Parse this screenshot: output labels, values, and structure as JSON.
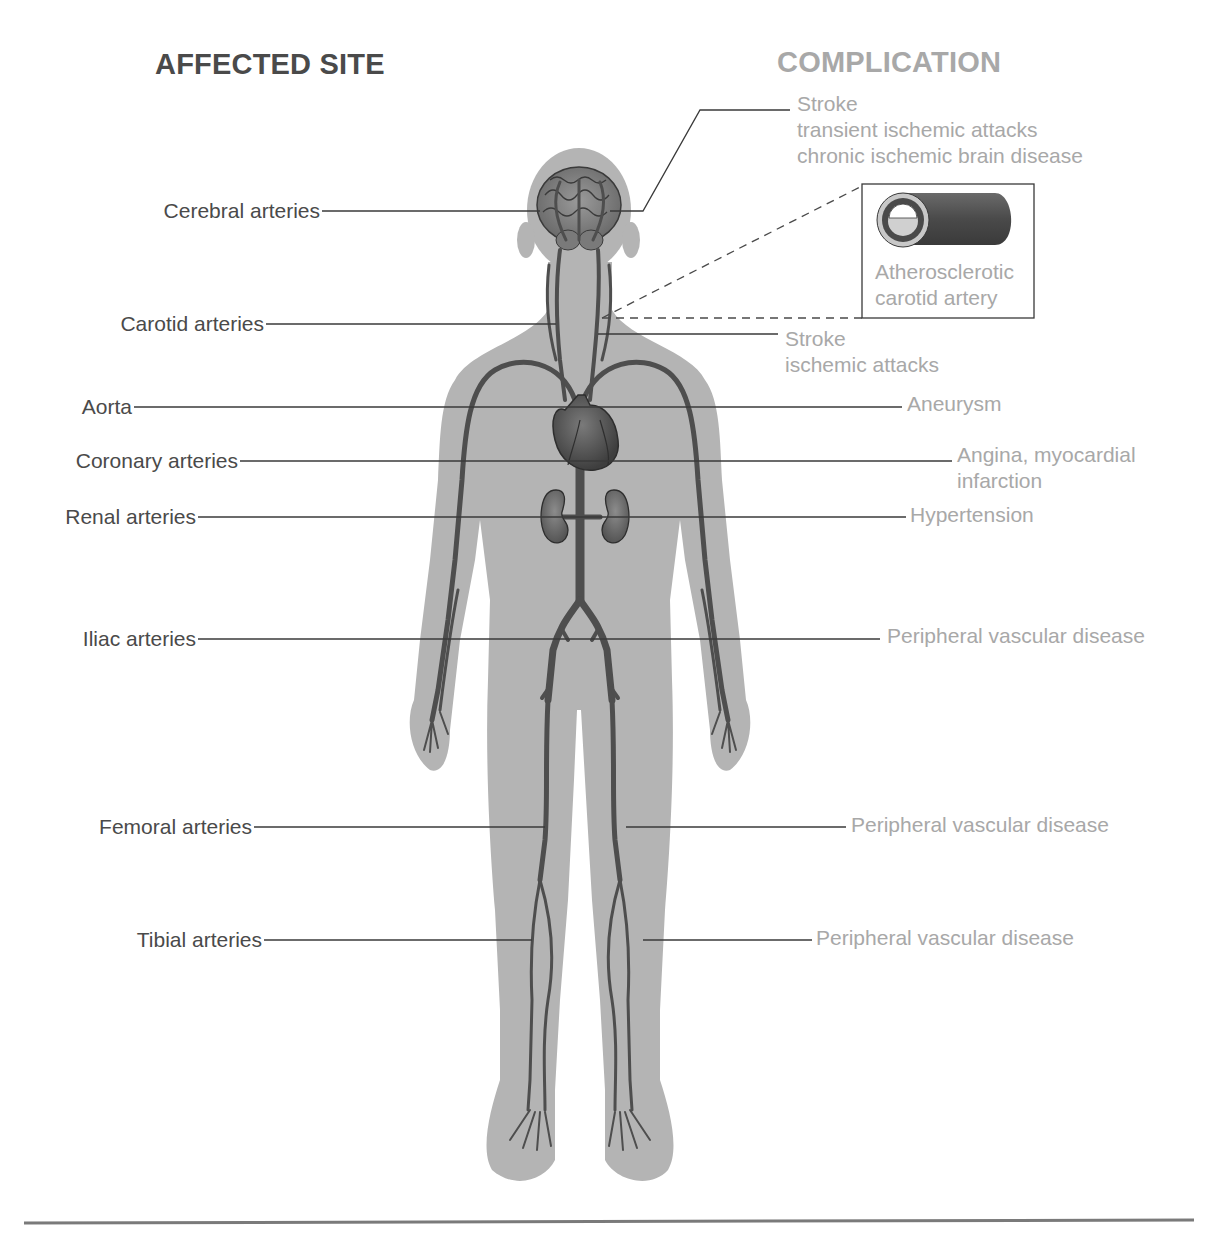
{
  "headings": {
    "affected_site": "AFFECTED SITE",
    "complication": "COMPLICATION"
  },
  "colors": {
    "heading_dark": "#4a4a4a",
    "heading_light": "#a8a8a8",
    "body_silhouette": "#b4b4b4",
    "artery": "#4e4e4e",
    "leader_line": "#3a3a3a",
    "bottom_rule": "#7a7a7a"
  },
  "affected_sites": [
    {
      "id": "cerebral",
      "label": "Cerebral arteries"
    },
    {
      "id": "carotid",
      "label": "Carotid arteries"
    },
    {
      "id": "aorta",
      "label": "Aorta"
    },
    {
      "id": "coronary",
      "label": "Coronary arteries"
    },
    {
      "id": "renal",
      "label": "Renal arteries"
    },
    {
      "id": "iliac",
      "label": "Iliac arteries"
    },
    {
      "id": "femoral",
      "label": "Femoral arteries"
    },
    {
      "id": "tibial",
      "label": "Tibial arteries"
    }
  ],
  "complications": [
    {
      "id": "cerebral",
      "lines": [
        "Stroke",
        "transient ischemic attacks",
        "chronic ischemic brain disease"
      ]
    },
    {
      "id": "carotid",
      "lines": [
        "Stroke",
        "ischemic attacks"
      ]
    },
    {
      "id": "aorta",
      "lines": [
        "Aneurysm"
      ]
    },
    {
      "id": "coronary",
      "lines": [
        "Angina, myocardial",
        "infarction"
      ]
    },
    {
      "id": "renal",
      "lines": [
        "Hypertension"
      ]
    },
    {
      "id": "iliac",
      "lines": [
        "Peripheral vascular disease"
      ]
    },
    {
      "id": "femoral",
      "lines": [
        "Peripheral vascular disease"
      ]
    },
    {
      "id": "tibial",
      "lines": [
        "Peripheral vascular disease"
      ]
    }
  ],
  "inset": {
    "title_lines": [
      "Atherosclerotic",
      "carotid artery"
    ],
    "icon": "artery-cross-section-icon"
  }
}
